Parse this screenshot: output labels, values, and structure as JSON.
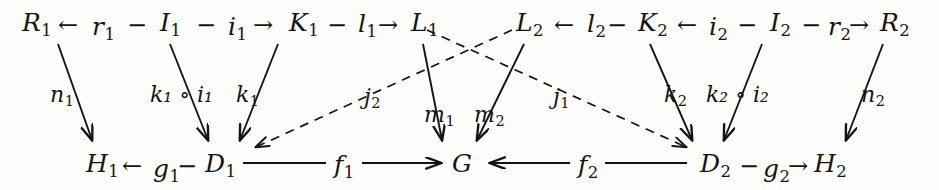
{
  "diagram": {
    "type": "commutative-diagram",
    "background": "#fdfdfc",
    "ink": "#141414",
    "top_row_left": {
      "items": [
        "R",
        "1",
        "←",
        "r",
        "1",
        "−",
        "I",
        "1",
        "−",
        "i",
        "1",
        "→",
        "K",
        "1",
        "−",
        "l",
        "1",
        "→",
        "L",
        "1"
      ],
      "text": "R₁ ← r₁ − I₁ − i₁ → K₁ − l₁ → L₁"
    },
    "top_row_right": {
      "text": "L₂ ← l₂ − K₂ ← i₂ − I₂ − r₂ → R₂"
    },
    "bottom_row_left": {
      "text": "H₁ ← g₁ − D₁ —— f₁ —→ G"
    },
    "bottom_row_right": {
      "text": "G ←—— f₂ ——→ D₂ − g₂ → H₂"
    },
    "nodes": [
      {
        "id": "R1",
        "base": "R",
        "sub": "1",
        "x": 22,
        "y": 10
      },
      {
        "id": "r1",
        "base": "r",
        "sub": "1",
        "x": 93,
        "y": 14
      },
      {
        "id": "I1",
        "base": "I",
        "sub": "1",
        "x": 160,
        "y": 10
      },
      {
        "id": "i1",
        "base": "i",
        "sub": "1",
        "x": 226,
        "y": 14
      },
      {
        "id": "K1",
        "base": "K",
        "sub": "1",
        "x": 290,
        "y": 10
      },
      {
        "id": "l1",
        "base": "l",
        "sub": "1",
        "x": 356,
        "y": 12
      },
      {
        "id": "L1",
        "base": "L",
        "sub": "1",
        "x": 410,
        "y": 10
      },
      {
        "id": "L2",
        "base": "L",
        "sub": "2",
        "x": 516,
        "y": 10
      },
      {
        "id": "l2",
        "base": "l",
        "sub": "2",
        "x": 585,
        "y": 12
      },
      {
        "id": "K2",
        "base": "K",
        "sub": "2",
        "x": 639,
        "y": 10
      },
      {
        "id": "i2",
        "base": "i",
        "sub": "2",
        "x": 707,
        "y": 14
      },
      {
        "id": "I2",
        "base": "I",
        "sub": "2",
        "x": 770,
        "y": 10
      },
      {
        "id": "r2",
        "base": "r",
        "sub": "2",
        "x": 827,
        "y": 14
      },
      {
        "id": "R2",
        "base": "R",
        "sub": "2",
        "x": 879,
        "y": 10
      },
      {
        "id": "H1",
        "base": "H",
        "sub": "1",
        "x": 86,
        "y": 152
      },
      {
        "id": "g1",
        "base": "g",
        "sub": "1",
        "x": 152,
        "y": 156
      },
      {
        "id": "D1",
        "base": "D",
        "sub": "1",
        "x": 204,
        "y": 152
      },
      {
        "id": "f1",
        "base": "f",
        "sub": "1",
        "x": 338,
        "y": 152
      },
      {
        "id": "G",
        "base": "G",
        "sub": "",
        "x": 456,
        "y": 152
      },
      {
        "id": "f2",
        "base": "f",
        "sub": "2",
        "x": 580,
        "y": 152
      },
      {
        "id": "D2",
        "base": "D",
        "sub": "2",
        "x": 700,
        "y": 152
      },
      {
        "id": "g2",
        "base": "g",
        "sub": "2",
        "x": 762,
        "y": 156
      },
      {
        "id": "H2",
        "base": "H",
        "sub": "2",
        "x": 814,
        "y": 152
      }
    ],
    "inline_arrows": [
      {
        "id": "arr-R1-r1",
        "glyph": "←",
        "x": 60,
        "y": 14
      },
      {
        "id": "dash-r1-I1",
        "glyph": "−",
        "x": 128,
        "y": 14
      },
      {
        "id": "dash-I1-i1",
        "glyph": "−",
        "x": 196,
        "y": 14
      },
      {
        "id": "arr-i1-K1",
        "glyph": "→",
        "x": 253,
        "y": 14
      },
      {
        "id": "dash-K1-l1",
        "glyph": "−",
        "x": 328,
        "y": 14
      },
      {
        "id": "arr-l1-L1",
        "glyph": "→",
        "x": 377,
        "y": 14
      },
      {
        "id": "arr-L2-l2",
        "glyph": "←",
        "x": 554,
        "y": 14
      },
      {
        "id": "dash-l2-K2",
        "glyph": "−",
        "x": 608,
        "y": 14
      },
      {
        "id": "arr-K2-i2",
        "glyph": "←",
        "x": 678,
        "y": 14
      },
      {
        "id": "dash-i2-I2",
        "glyph": "−",
        "x": 738,
        "y": 14
      },
      {
        "id": "dash-I2-r2",
        "glyph": "−",
        "x": 801,
        "y": 14
      },
      {
        "id": "arr-r2-R2",
        "glyph": "→",
        "x": 848,
        "y": 14
      },
      {
        "id": "arr-H1-g1",
        "glyph": "←",
        "x": 122,
        "y": 156
      },
      {
        "id": "dash-g1-D1",
        "glyph": "−",
        "x": 178,
        "y": 156
      },
      {
        "id": "dash-D2-g2",
        "glyph": "−",
        "x": 740,
        "y": 156
      },
      {
        "id": "arr-g2-H2",
        "glyph": "→",
        "x": 789,
        "y": 156
      }
    ],
    "edge_labels": [
      {
        "id": "n1",
        "text": "n",
        "sub": "1",
        "x": 50,
        "y": 85
      },
      {
        "id": "k1oi1",
        "text": "k₁ ∘ i₁",
        "sub": "",
        "x": 154,
        "y": 85
      },
      {
        "id": "k1",
        "text": "k",
        "sub": "1",
        "x": 235,
        "y": 85
      },
      {
        "id": "j2",
        "text": "j",
        "sub": "2",
        "x": 363,
        "y": 88
      },
      {
        "id": "m1",
        "text": "m",
        "sub": "1",
        "x": 425,
        "y": 105
      },
      {
        "id": "m2",
        "text": "m",
        "sub": "2",
        "x": 477,
        "y": 105
      },
      {
        "id": "j1",
        "text": "j",
        "sub": "1",
        "x": 553,
        "y": 88
      },
      {
        "id": "k2",
        "text": "k",
        "sub": "2",
        "x": 666,
        "y": 85
      },
      {
        "id": "k2oi2",
        "text": "k₂ ∘ i₂",
        "sub": "",
        "x": 708,
        "y": 85
      },
      {
        "id": "n2",
        "text": "n",
        "sub": "2",
        "x": 860,
        "y": 85
      }
    ],
    "solid_edges": [
      {
        "id": "edge-R1-H1",
        "from": "R1",
        "to": "H1",
        "label": "n1",
        "x1": 58,
        "y1": 44,
        "x2": 92,
        "y2": 140
      },
      {
        "id": "edge-I1-D1",
        "from": "I1",
        "to": "D1",
        "label": "k1oi1",
        "x1": 170,
        "y1": 44,
        "x2": 208,
        "y2": 140
      },
      {
        "id": "edge-K1-D1",
        "from": "K1",
        "to": "D1",
        "label": "k1",
        "x1": 278,
        "y1": 44,
        "x2": 240,
        "y2": 140
      },
      {
        "id": "edge-L1-G",
        "from": "L1",
        "to": "G",
        "label": "m1",
        "x1": 423,
        "y1": 44,
        "x2": 442,
        "y2": 140
      },
      {
        "id": "edge-L2-G",
        "from": "L2",
        "to": "G",
        "label": "m2",
        "x1": 524,
        "y1": 44,
        "x2": 477,
        "y2": 140
      },
      {
        "id": "edge-K2-D2",
        "from": "K2",
        "to": "D2",
        "label": "k2",
        "x1": 650,
        "y1": 44,
        "x2": 692,
        "y2": 140
      },
      {
        "id": "edge-I2-D2",
        "from": "I2",
        "to": "D2",
        "label": "k2oi2",
        "x1": 762,
        "y1": 44,
        "x2": 724,
        "y2": 140
      },
      {
        "id": "edge-R2-H2",
        "from": "R2",
        "to": "H2",
        "label": "n2",
        "x1": 883,
        "y1": 44,
        "x2": 846,
        "y2": 140
      }
    ],
    "dashed_edges": [
      {
        "id": "edge-L2-D1",
        "from": "L2",
        "to": "D1",
        "label": "j2",
        "x1": 512,
        "y1": 30,
        "x2": 254,
        "y2": 148
      },
      {
        "id": "edge-L1-D2",
        "from": "L1",
        "to": "D2",
        "label": "j1",
        "x1": 425,
        "y1": 30,
        "x2": 688,
        "y2": 148
      }
    ],
    "long_edges": [
      {
        "id": "edge-D1-G",
        "from": "D1",
        "to": "G",
        "label": "f1",
        "x1": 243,
        "y1": 163,
        "x2": 440,
        "y2": 163,
        "arrow": "end"
      },
      {
        "id": "edge-D2-G",
        "from": "D2",
        "to": "G",
        "label": "f2",
        "x1": 687,
        "y1": 163,
        "x2": 489,
        "y2": 163,
        "arrow": "start"
      }
    ]
  }
}
